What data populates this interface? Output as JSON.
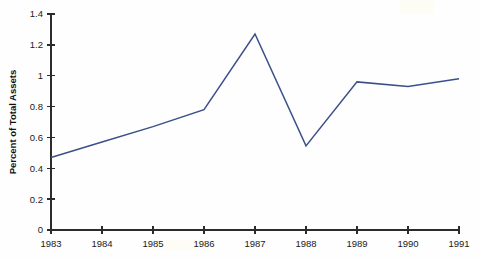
{
  "chart_data": {
    "type": "line",
    "title": "",
    "subtitle": "",
    "xlabel": "",
    "ylabel": "Percent of Total Assets",
    "categories": [
      "1983",
      "1984",
      "1985",
      "1986",
      "1987",
      "1988",
      "1989",
      "1990",
      "1991"
    ],
    "x": [
      1983,
      1984,
      1985,
      1986,
      1987,
      1988,
      1989,
      1990,
      1991
    ],
    "values": [
      0.47,
      0.57,
      0.67,
      0.78,
      1.27,
      0.545,
      0.96,
      0.93,
      0.98
    ],
    "series": [
      {
        "name": "Percent of Total Assets",
        "values": [
          0.47,
          0.57,
          0.67,
          0.78,
          1.27,
          0.545,
          0.96,
          0.93,
          0.98
        ],
        "color": "#3b4f8a"
      }
    ],
    "xlim": [
      1983,
      1991
    ],
    "ylim": [
      0,
      1.4
    ],
    "yticks": [
      0,
      0.2,
      0.4,
      0.6,
      0.8,
      1,
      1.2,
      1.4
    ],
    "ytick_labels": [
      "0",
      "0.2",
      "0.4",
      "0.6",
      "0.8",
      "1",
      "1.2",
      "1.4"
    ],
    "xticks": [
      1983,
      1984,
      1985,
      1986,
      1987,
      1988,
      1989,
      1990,
      1991
    ],
    "xtick_labels": [
      "1983",
      "1984",
      "1985",
      "1986",
      "1987",
      "1988",
      "1989",
      "1990",
      "1991"
    ],
    "grid": false,
    "legend": false,
    "legend_position": "none",
    "line_color": "#3b4f8a",
    "axis_color": "#2b2b2b",
    "background_color": "#fefefe",
    "annotations": []
  }
}
